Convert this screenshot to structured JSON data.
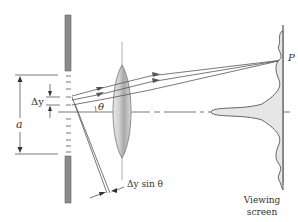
{
  "diagram": {
    "labels": {
      "point_p": "P",
      "theta": "θ",
      "delta_y": "Δy",
      "slit_width": "a",
      "path_difference": "Δy sin θ",
      "screen_line1": "Viewing",
      "screen_line2": "screen"
    },
    "colors": {
      "line": "#555555",
      "barrier": "#8a8a8a",
      "lens_fill": "#c8c8c8",
      "pattern_fill": "#e6e6e6",
      "text": "#333333"
    }
  }
}
